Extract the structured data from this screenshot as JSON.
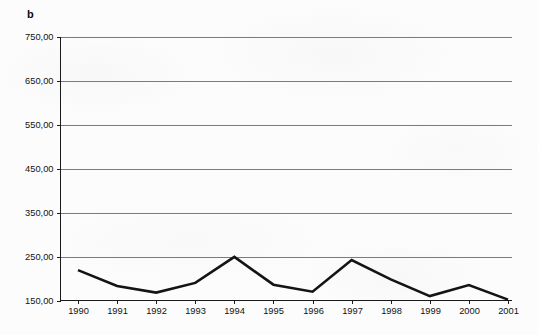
{
  "panel": {
    "label": "b"
  },
  "chart_data": {
    "type": "line",
    "title": "",
    "subtitle": "",
    "xlabel": "",
    "ylabel": "",
    "categories": [
      "1990",
      "1991",
      "1992",
      "1993",
      "1994",
      "1995",
      "1996",
      "1997",
      "1998",
      "1999",
      "2000",
      "2001"
    ],
    "values": [
      219,
      183,
      168,
      190,
      249,
      186,
      170,
      242,
      198,
      160,
      185,
      152
    ],
    "series": [
      {
        "name": "series-1",
        "values": [
          219,
          183,
          168,
          190,
          249,
          186,
          170,
          242,
          198,
          160,
          185,
          152
        ]
      }
    ],
    "ylim": [
      150,
      750
    ],
    "ytick_values": [
      150,
      250,
      350,
      450,
      550,
      650,
      750
    ],
    "ytick_labels": [
      "150,00",
      "250,00",
      "350,00",
      "450,00",
      "550,00",
      "650,00",
      "750,00"
    ],
    "xtick_labels": [
      "1990",
      "1991",
      "1992",
      "1993",
      "1994",
      "1995",
      "1996",
      "1997",
      "1998",
      "1999",
      "2000",
      "2001"
    ],
    "grid": true,
    "legend": false,
    "legend_position": "none",
    "decimal_separator": ",",
    "line_color": "#141414",
    "grid_color": "#7b7b7b",
    "axis_color": "#1a1a1a",
    "background_color": "#fcfcfc"
  }
}
